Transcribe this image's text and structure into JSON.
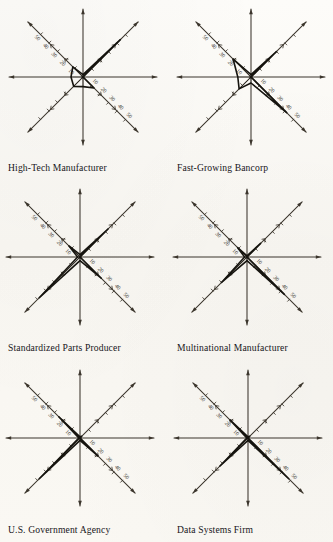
{
  "page": {
    "background_color": "#fbfaf6",
    "ink_color": "#16140f",
    "axis_color": "#3b352c",
    "layout": "2 columns x 3 rows of star (radar) plots"
  },
  "axis_tick_labels": [
    "10",
    "20",
    "30",
    "40",
    "50"
  ],
  "chart_data": [
    {
      "type": "radar",
      "title": "High-Tech Manufacturer",
      "axes": [
        "upper-left",
        "up",
        "upper-right",
        "right",
        "lower-right",
        "down",
        "lower-left",
        "left"
      ],
      "axis_max": 50,
      "grid": false,
      "legend": "none",
      "tick_labels": [
        "10",
        "20",
        "30",
        "40",
        "50"
      ],
      "values": {
        "upper-left": 12,
        "up": 2,
        "upper-right": 44,
        "right": 0,
        "lower-right": 13,
        "down": 8,
        "lower-left": 11,
        "left": 10
      }
    },
    {
      "type": "radar",
      "title": "Fast-Growing Bancorp",
      "axes": [
        "upper-left",
        "up",
        "upper-right",
        "right",
        "lower-right",
        "down",
        "lower-left",
        "left"
      ],
      "axis_max": 50,
      "grid": false,
      "legend": "none",
      "tick_labels": [
        "10",
        "20",
        "30",
        "40",
        "50"
      ],
      "values": {
        "upper-left": 21,
        "up": 2,
        "upper-right": 30,
        "right": 0,
        "lower-right": 42,
        "down": 5,
        "lower-left": 14,
        "left": 11
      }
    },
    {
      "type": "radar",
      "title": "Standardized Parts Producer",
      "axes": [
        "upper-left",
        "up",
        "upper-right",
        "right",
        "lower-right",
        "down",
        "lower-left",
        "left"
      ],
      "axis_max": 50,
      "grid": false,
      "legend": "none",
      "tick_labels": [
        "10",
        "20",
        "30",
        "40",
        "50"
      ],
      "values": {
        "upper-left": 13,
        "up": 2,
        "upper-right": 33,
        "right": 0,
        "lower-right": 25,
        "down": 3,
        "lower-left": 48,
        "left": 2
      }
    },
    {
      "type": "radar",
      "title": "Multinational Manufacturer",
      "axes": [
        "upper-left",
        "up",
        "upper-right",
        "right",
        "lower-right",
        "down",
        "lower-left",
        "left"
      ],
      "axis_max": 50,
      "grid": false,
      "legend": "none",
      "tick_labels": [
        "10",
        "20",
        "30",
        "40",
        "50"
      ],
      "values": {
        "upper-left": 11,
        "up": 1,
        "upper-right": 16,
        "right": 0,
        "lower-right": 44,
        "down": 3,
        "lower-left": 30,
        "left": 2
      }
    },
    {
      "type": "radar",
      "title": "U.S. Government Agency",
      "axes": [
        "upper-left",
        "up",
        "upper-right",
        "right",
        "lower-right",
        "down",
        "lower-left",
        "left"
      ],
      "axis_max": 50,
      "grid": false,
      "legend": "none",
      "tick_labels": [
        "10",
        "20",
        "30",
        "40",
        "50"
      ],
      "values": {
        "upper-left": 25,
        "up": 1,
        "upper-right": 2,
        "right": 0,
        "lower-right": 21,
        "down": 2,
        "lower-left": 48,
        "left": 1
      }
    },
    {
      "type": "radar",
      "title": "Data Systems Firm",
      "axes": [
        "upper-left",
        "up",
        "upper-right",
        "right",
        "lower-right",
        "down",
        "lower-left",
        "left"
      ],
      "axis_max": 50,
      "grid": false,
      "legend": "none",
      "tick_labels": [
        "10",
        "20",
        "30",
        "40",
        "50"
      ],
      "values": {
        "upper-left": 21,
        "up": 1,
        "upper-right": 2,
        "right": 0,
        "lower-right": 48,
        "down": 2,
        "lower-left": 33,
        "left": 1
      }
    }
  ]
}
